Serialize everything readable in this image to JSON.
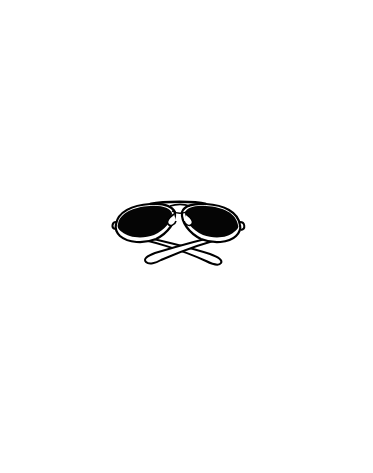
{
  "image": {
    "subject": "aviator sunglasses with crossed temples",
    "style": "black ink illustration on white background",
    "width": 373,
    "height": 473
  },
  "colors": {
    "background": "#ffffff",
    "lens": "#050505",
    "outline": "#000000",
    "frame_fill": "#ffffff"
  },
  "elements": {
    "left_lens": {
      "label": "left lens"
    },
    "right_lens": {
      "label": "right lens"
    },
    "bridge": {
      "label": "bridge"
    },
    "left_temple": {
      "label": "left temple arm"
    },
    "right_temple": {
      "label": "right temple arm"
    },
    "nose_pads": {
      "label": "nose pads"
    }
  }
}
